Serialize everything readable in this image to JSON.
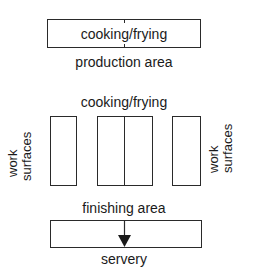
{
  "diagram": {
    "top_section": {
      "box_label": "cooking/frying",
      "caption": "production area"
    },
    "middle_section": {
      "heading": "cooking/frying",
      "left_label_line1": "work",
      "left_label_line2": "surfaces",
      "right_label_line1": "work",
      "right_label_line2": "surfaces"
    },
    "bottom_section": {
      "heading": "finishing area",
      "caption": "servery",
      "arrow": "down-arrow"
    },
    "colors": {
      "line": "#2a2a2a",
      "text": "#1a1a1a",
      "background": "#ffffff"
    }
  }
}
